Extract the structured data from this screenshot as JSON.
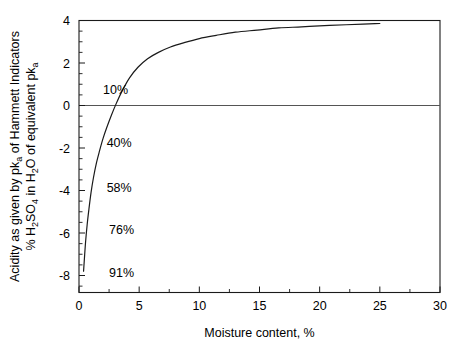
{
  "chart_data": {
    "type": "line",
    "title": "",
    "xlabel": "Moisture content, %",
    "ylabel_line1": "Acidity as given by pk",
    "ylabel_line1_sub": "a",
    "ylabel_line1_tail": " of Hammett Indicators",
    "ylabel_line2_pre": "% H",
    "ylabel_line2_sub1": "2",
    "ylabel_line2_mid1": "SO",
    "ylabel_line2_sub2": "4",
    "ylabel_line2_mid2": " in H",
    "ylabel_line2_sub3": "2",
    "ylabel_line2_mid3": "O of equivalent pk",
    "ylabel_line2_sub4": "a",
    "xlim": [
      0,
      30
    ],
    "ylim": [
      -8.8,
      4
    ],
    "x_major_ticks": [
      0,
      5,
      10,
      15,
      20,
      25,
      30
    ],
    "x_major_tick_labels": [
      "0",
      "5",
      "10",
      "15",
      "20",
      "25",
      "30"
    ],
    "x_minor_tick_step": 2.5,
    "y_major_ticks": [
      4,
      2,
      0,
      -2,
      -4,
      -6,
      -8
    ],
    "y_major_tick_labels": [
      "4",
      "2",
      "0",
      "-2",
      "-4",
      "-6",
      "-8"
    ],
    "y_minor_tick_step": 0.5,
    "grid": false,
    "legend": "none",
    "zero_reference_line": 0,
    "series": [
      {
        "name": "Acidity vs moisture content",
        "x": [
          0.38,
          0.45,
          0.55,
          0.68,
          0.82,
          1.0,
          1.2,
          1.45,
          1.7,
          2.0,
          2.3,
          2.7,
          3.1,
          3.6,
          4.2,
          4.9,
          5.7,
          6.6,
          7.6,
          8.7,
          10.0,
          11.4,
          13.0,
          14.8,
          16.6,
          18.5,
          20.4,
          22.2,
          23.6,
          24.6,
          25.0
        ],
        "y": [
          -7.8,
          -7.2,
          -6.4,
          -5.6,
          -4.9,
          -4.1,
          -3.4,
          -2.7,
          -2.15,
          -1.55,
          -1.05,
          -0.45,
          0.1,
          0.7,
          1.3,
          1.8,
          2.2,
          2.5,
          2.75,
          2.95,
          3.15,
          3.3,
          3.45,
          3.55,
          3.65,
          3.7,
          3.76,
          3.8,
          3.83,
          3.85,
          3.86
        ]
      }
    ],
    "annotations": [
      {
        "text": "10%",
        "x": 2.0,
        "y": 0.55,
        "name": "annotation-10-percent"
      },
      {
        "text": "40%",
        "x": 2.3,
        "y": -1.95,
        "name": "annotation-40-percent"
      },
      {
        "text": "58%",
        "x": 2.3,
        "y": -4.05,
        "name": "annotation-58-percent"
      },
      {
        "text": "76%",
        "x": 2.5,
        "y": -6.05,
        "name": "annotation-76-percent"
      },
      {
        "text": "91%",
        "x": 2.5,
        "y": -8.05,
        "name": "annotation-91-percent"
      }
    ],
    "colors": {
      "curve": "#1a1a1a",
      "frame": "#1a1a1a",
      "zero_line": "#555555",
      "background": "#ffffff"
    }
  }
}
